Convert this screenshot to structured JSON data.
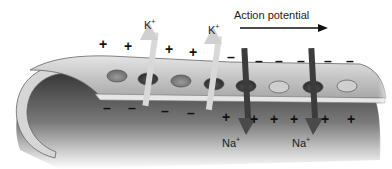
{
  "diagram": {
    "title": "Action potential",
    "direction_arrow": "right",
    "ions": {
      "potassium": {
        "symbol": "K",
        "charge": "+",
        "direction": "out"
      },
      "sodium": {
        "symbol": "Na",
        "charge": "+",
        "direction": "in"
      }
    },
    "labels": {
      "action_potential": "Action potential",
      "k_label_1": "K",
      "k_label_2": "K",
      "na_label_1": "Na",
      "na_label_2": "Na",
      "plus": "+",
      "minus": "–"
    },
    "outside_top_signs": [
      "+",
      "+",
      "+",
      "+",
      "+",
      "–",
      "–",
      "–",
      "–",
      "–",
      "–",
      "–"
    ],
    "inside_bottom_signs": [
      "–",
      "–",
      "–",
      "–",
      "+",
      "+",
      "+",
      "+",
      "+",
      "+"
    ],
    "colors": {
      "membrane_light": "#dcdcdc",
      "membrane_mid": "#b4b4b4",
      "interior_dark": "#3a3a3a",
      "k_arrow": "#d8d8d8",
      "na_channel": "#3c3c3c",
      "text": "#222222"
    }
  }
}
